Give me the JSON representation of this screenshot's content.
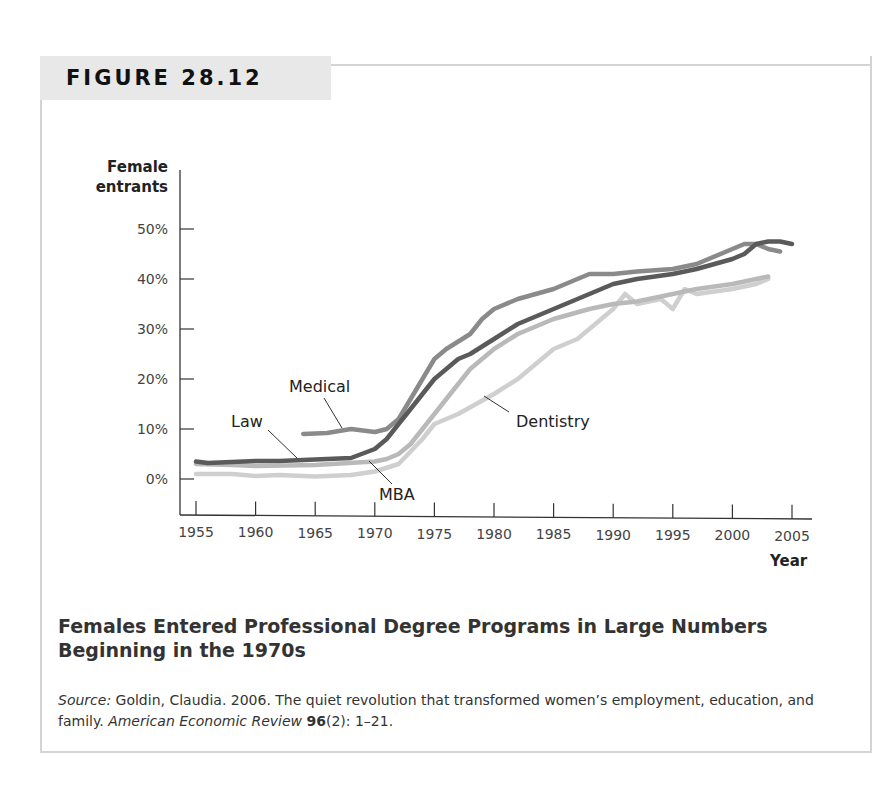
{
  "figure": {
    "label": "FIGURE 28.12",
    "title": "Females Entered Professional Degree Programs in Large Numbers Beginning in the 1970s",
    "source_prefix": "Source:",
    "source_text": "Goldin, Claudia. 2006. The quiet revolution that transformed women’s employment, education, and family.",
    "journal": "American Economic Review",
    "volume": "96",
    "issue_pages": "(2): 1–21."
  },
  "chart_data": {
    "type": "line",
    "title": "Females Entered Professional Degree Programs in Large Numbers Beginning in the 1970s",
    "xlabel": "Year",
    "ylabel_line1": "Female",
    "ylabel_line2": "entrants",
    "ylabel": "Female entrants",
    "xlim": [
      1955,
      2005
    ],
    "ylim": [
      0,
      50
    ],
    "grid": false,
    "x_ticks": [
      "1955",
      "1960",
      "1965",
      "1970",
      "1975",
      "1980",
      "1985",
      "1990",
      "1995",
      "2000",
      "2005"
    ],
    "y_ticks": [
      "0%",
      "10%",
      "20%",
      "30%",
      "40%",
      "50%"
    ],
    "legend_position": "inline labels",
    "series": [
      {
        "name": "Law",
        "color": "#5a5a5a",
        "x": [
          1955,
          1956,
          1958,
          1960,
          1962,
          1964,
          1966,
          1968,
          1970,
          1971,
          1972,
          1973,
          1974,
          1975,
          1976,
          1977,
          1978,
          1980,
          1982,
          1985,
          1988,
          1990,
          1992,
          1995,
          1997,
          2000,
          2001,
          2002,
          2003,
          2004,
          2005
        ],
        "y": [
          3.5,
          3.2,
          3.4,
          3.6,
          3.6,
          3.8,
          4,
          4.2,
          6,
          8,
          11,
          14,
          17,
          20,
          22,
          24,
          25,
          28,
          31,
          34,
          37,
          39,
          40,
          41,
          42,
          44,
          45,
          47,
          47.5,
          47.5,
          47
        ]
      },
      {
        "name": "Medical",
        "color": "#8a8a8a",
        "x": [
          1964,
          1966,
          1968,
          1970,
          1971,
          1972,
          1973,
          1974,
          1975,
          1976,
          1978,
          1979,
          1980,
          1982,
          1985,
          1987,
          1988,
          1990,
          1992,
          1995,
          1997,
          2000,
          2001,
          2002,
          2003,
          2004
        ],
        "y": [
          9,
          9.2,
          10,
          9.4,
          10,
          12,
          16,
          20,
          24,
          26,
          29,
          32,
          34,
          36,
          38,
          40,
          41,
          41,
          41.5,
          42,
          43,
          46,
          47,
          47,
          46,
          45.5
        ]
      },
      {
        "name": "MBA",
        "color": "#b9b9b9",
        "x": [
          1955,
          1958,
          1960,
          1965,
          1970,
          1971,
          1972,
          1973,
          1974,
          1975,
          1976,
          1977,
          1978,
          1980,
          1982,
          1985,
          1988,
          1990,
          1992,
          1995,
          1997,
          2000,
          2002,
          2003
        ],
        "y": [
          3,
          2.8,
          2.6,
          2.8,
          3.5,
          4,
          5,
          7,
          10,
          13,
          16,
          19,
          22,
          26,
          29,
          32,
          34,
          35,
          35.5,
          37,
          38,
          39,
          40,
          40.5
        ]
      },
      {
        "name": "Dentistry",
        "color": "#cfcfcf",
        "x": [
          1955,
          1958,
          1960,
          1962,
          1965,
          1968,
          1970,
          1972,
          1974,
          1975,
          1977,
          1980,
          1982,
          1984,
          1985,
          1987,
          1989,
          1990,
          1991,
          1992,
          1994,
          1995,
          1996,
          1997,
          2000,
          2002,
          2003
        ],
        "y": [
          1,
          1,
          0.6,
          0.8,
          0.5,
          0.8,
          1.5,
          3,
          8,
          11,
          13,
          17,
          20,
          24,
          26,
          28,
          32,
          34,
          37,
          35,
          36,
          34,
          38,
          37,
          38,
          39,
          40
        ]
      }
    ]
  },
  "annotations": {
    "law": "Law",
    "medical": "Medical",
    "mba": "MBA",
    "dentistry": "Dentistry"
  }
}
